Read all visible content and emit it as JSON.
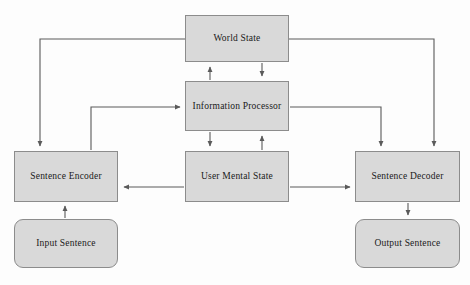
{
  "diagram": {
    "style": {
      "node_fill": "#d9d9d9",
      "node_stroke": "#8c8c8c",
      "edge_stroke": "#5a5a5a",
      "background": "#fdfdfd",
      "text_color": "#1a1a1a"
    },
    "nodes": [
      {
        "id": "world_state",
        "label": "World State",
        "shape": "rect",
        "x": 185,
        "y": 15,
        "w": 104,
        "h": 47
      },
      {
        "id": "information_processor",
        "label": "Information Processor",
        "shape": "rect",
        "x": 185,
        "y": 81,
        "w": 104,
        "h": 50
      },
      {
        "id": "sentence_encoder",
        "label": "Sentence Encoder",
        "shape": "rect",
        "x": 14,
        "y": 151,
        "w": 104,
        "h": 51
      },
      {
        "id": "user_mental_state",
        "label": "User Mental State",
        "shape": "rect",
        "x": 185,
        "y": 151,
        "w": 104,
        "h": 51
      },
      {
        "id": "sentence_decoder",
        "label": "Sentence Decoder",
        "shape": "rect",
        "x": 355,
        "y": 151,
        "w": 105,
        "h": 51
      },
      {
        "id": "input_sentence",
        "label": "Input Sentence",
        "shape": "rounded",
        "x": 14,
        "y": 219,
        "w": 104,
        "h": 49
      },
      {
        "id": "output_sentence",
        "label": "Output Sentence",
        "shape": "rounded",
        "x": 355,
        "y": 219,
        "w": 105,
        "h": 49
      }
    ],
    "edges": [
      {
        "id": "edge-world-state-to-sentence-encoder",
        "from": "world_state",
        "to": "sentence_encoder",
        "path": "M 185 39 L 40 39 L 40 146",
        "arrow_at": "end"
      },
      {
        "id": "edge-world-state-to-sentence-decoder",
        "from": "world_state",
        "to": "sentence_decoder",
        "path": "M 289 39 L 434 39 L 434 146",
        "arrow_at": "end"
      },
      {
        "id": "edge-information-processor-to-world-state",
        "from": "information_processor",
        "to": "world_state",
        "path": "M 210 80 L 210 67",
        "arrow_at": "end"
      },
      {
        "id": "edge-world-state-to-information-processor",
        "from": "world_state",
        "to": "information_processor",
        "path": "M 262 63 L 262 76",
        "arrow_at": "end"
      },
      {
        "id": "edge-sentence-encoder-to-information-processor",
        "from": "sentence_encoder",
        "to": "information_processor",
        "path": "M 91 150 L 91 107 L 180 107",
        "arrow_at": "end"
      },
      {
        "id": "edge-information-processor-to-sentence-decoder",
        "from": "information_processor",
        "to": "sentence_decoder",
        "path": "M 290 107 L 381 107 L 381 146",
        "arrow_at": "end"
      },
      {
        "id": "edge-information-processor-to-user-mental-state",
        "from": "information_processor",
        "to": "user_mental_state",
        "path": "M 210 132 L 210 146",
        "arrow_at": "end"
      },
      {
        "id": "edge-user-mental-state-to-information-processor",
        "from": "user_mental_state",
        "to": "information_processor",
        "path": "M 262 150 L 262 136",
        "arrow_at": "end"
      },
      {
        "id": "edge-user-mental-state-to-sentence-encoder",
        "from": "user_mental_state",
        "to": "sentence_encoder",
        "path": "M 184 187 L 124 187",
        "arrow_at": "end"
      },
      {
        "id": "edge-user-mental-state-to-sentence-decoder",
        "from": "user_mental_state",
        "to": "sentence_decoder",
        "path": "M 290 187 L 350 187",
        "arrow_at": "end"
      },
      {
        "id": "edge-input-sentence-to-sentence-encoder",
        "from": "input_sentence",
        "to": "sentence_encoder",
        "path": "M 65 218 L 65 206",
        "arrow_at": "end"
      },
      {
        "id": "edge-sentence-decoder-to-output-sentence",
        "from": "sentence_decoder",
        "to": "output_sentence",
        "path": "M 408 203 L 408 215",
        "arrow_at": "end"
      }
    ]
  }
}
